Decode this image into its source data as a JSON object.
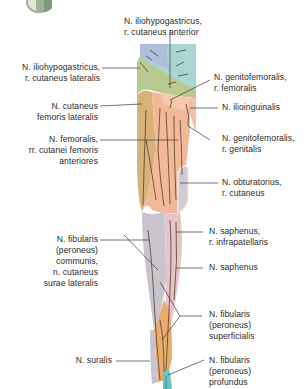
{
  "diagram": {
    "type": "anatomical-illustration",
    "colors": {
      "iliohypogastricus_anterior": "#a9d6d2",
      "iliohypogastricus_lateral": "#b9c98f",
      "cutaneus_femoris_lateralis": "#d9b27a",
      "femoralis_anterior": "#f2b89a",
      "genitofemoralis": "#f6c9ae",
      "ilioinguinalis": "#f4c0a8",
      "obturatorius": "#cfcbd3",
      "saphenus": "#e7c3cb",
      "fibularis_communis": "#c9c5cc",
      "fibularis_superficialis": "#e8ad6d",
      "fibularis_profundus": "#66c4c6",
      "suralis": "#c7c3d4",
      "nerve_line": "#5a3e2a",
      "leader_line": "#3a3a3a"
    },
    "labels": {
      "ilio_anterior": "N. iliohypogastricus,\nr. cutaneus anterior",
      "ilio_lateral": "N. iliohypogastricus,\nr. cutaneus lateralis",
      "genito_femoralis": "N. genitofemoralis,\nr. femoralis",
      "cutaneus_fem_lat": "N. cutaneus\nfemoris lateralis",
      "ilioinguinalis": "N. ilioinguinalis",
      "femoralis": "N. femoralis,\nrr. cutanei femoris\nanteriores",
      "genito_genitalis": "N. genitofemoralis,\nr. genitalis",
      "obturatorius": "N. obturatorius,\nr. cutaneus",
      "saphenus_infra": "N. saphenus,\nr. infrapatellaris",
      "fibularis_communis": "N. fibularis\n(peroneus)\ncommunis,\nn. cutaneus\nsurae lateralis",
      "saphenus": "N. saphenus",
      "fibularis_superficialis": "N. fibularis\n(peroneus)\nsuperficialis",
      "suralis": "N. suralis",
      "fibularis_profundus": "N. fibularis\n(peroneus)\nprofundus"
    }
  }
}
